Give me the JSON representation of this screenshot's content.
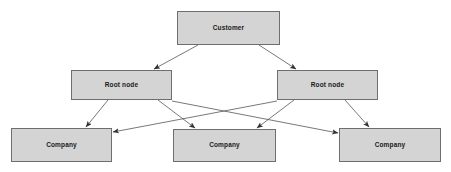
{
  "diagram": {
    "type": "hierarchy-graph",
    "title": "",
    "background_color": "#ffffff",
    "node_fill_color": "#d4d4d4",
    "node_border_color": "#6e6e6e",
    "edge_color": "#555555",
    "label_color": "#1a1a1a",
    "levels": [
      {
        "name": "customer-level",
        "nodes": [
          {
            "id": "customer",
            "label": "Customer",
            "x": 177,
            "y": 11,
            "w": 103,
            "h": 34
          }
        ]
      },
      {
        "name": "root-level",
        "nodes": [
          {
            "id": "root-left",
            "label": "Root node",
            "x": 71,
            "y": 70,
            "w": 101,
            "h": 30
          },
          {
            "id": "root-right",
            "label": "Root node",
            "x": 277,
            "y": 70,
            "w": 101,
            "h": 30
          }
        ]
      },
      {
        "name": "company-level",
        "nodes": [
          {
            "id": "company-left",
            "label": "Company",
            "x": 11,
            "y": 128,
            "w": 101,
            "h": 34
          },
          {
            "id": "company-middle",
            "label": "Company",
            "x": 173,
            "y": 129,
            "w": 103,
            "h": 33
          },
          {
            "id": "company-right",
            "label": "Company",
            "x": 339,
            "y": 128,
            "w": 102,
            "h": 34
          }
        ]
      }
    ],
    "edges": [
      {
        "id": "edge-customer-to-root-left",
        "from": "customer",
        "to": "root-left",
        "x1": 198,
        "y1": 45,
        "x2": 154,
        "y2": 69
      },
      {
        "id": "edge-customer-to-root-right",
        "from": "customer",
        "to": "root-right",
        "x1": 259,
        "y1": 45,
        "x2": 296,
        "y2": 69
      },
      {
        "id": "edge-root-left-to-company-left",
        "from": "root-left",
        "to": "company-left",
        "x1": 108,
        "y1": 100,
        "x2": 86,
        "y2": 127
      },
      {
        "id": "edge-root-left-to-company-middle",
        "from": "root-left",
        "to": "company-middle",
        "x1": 158,
        "y1": 100,
        "x2": 195,
        "y2": 128
      },
      {
        "id": "edge-root-left-to-company-right",
        "from": "root-left",
        "to": "company-right",
        "x1": 172,
        "y1": 101,
        "x2": 338,
        "y2": 133
      },
      {
        "id": "edge-root-right-to-company-left",
        "from": "root-right",
        "to": "company-left",
        "x1": 277,
        "y1": 101,
        "x2": 113,
        "y2": 132
      },
      {
        "id": "edge-root-right-to-company-middle",
        "from": "root-right",
        "to": "company-middle",
        "x1": 294,
        "y1": 100,
        "x2": 257,
        "y2": 128
      },
      {
        "id": "edge-root-right-to-company-right",
        "from": "root-right",
        "to": "company-right",
        "x1": 345,
        "y1": 100,
        "x2": 369,
        "y2": 127
      }
    ]
  }
}
